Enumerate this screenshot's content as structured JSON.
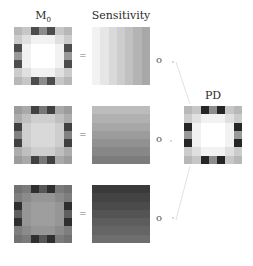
{
  "titles": {
    "m0": "M",
    "m0_sub": "0",
    "sensitivity": "Sensitivity",
    "pd": "PD"
  },
  "operators": {
    "equals": "=",
    "compose": "o"
  },
  "rows": [
    {
      "name": "row-1",
      "m0_intensity": 1.0,
      "sensitivity_direction": "horizontal",
      "sens_start": "#f2f2f2",
      "sens_end": "#a8a8a8"
    },
    {
      "name": "row-2",
      "m0_intensity": 0.85,
      "sensitivity_direction": "vertical",
      "sens_start": "#bcbcbc",
      "sens_end": "#7c7c7c"
    },
    {
      "name": "row-3",
      "m0_intensity": 0.62,
      "sensitivity_direction": "vertical",
      "sens_start": "#3a3a3a",
      "sens_end": "#6e6e6e"
    }
  ],
  "pattern_7x7": [
    [
      0.72,
      0.78,
      0.3,
      0.55,
      0.3,
      0.78,
      0.72
    ],
    [
      0.8,
      0.88,
      0.95,
      0.95,
      0.95,
      0.88,
      0.8
    ],
    [
      0.3,
      0.95,
      1.0,
      1.0,
      1.0,
      0.95,
      0.3
    ],
    [
      0.6,
      0.95,
      1.0,
      1.0,
      1.0,
      0.95,
      0.6
    ],
    [
      0.3,
      0.95,
      1.0,
      1.0,
      1.0,
      0.95,
      0.3
    ],
    [
      0.8,
      0.88,
      0.95,
      0.95,
      0.95,
      0.88,
      0.8
    ],
    [
      0.72,
      0.78,
      0.3,
      0.55,
      0.3,
      0.78,
      0.72
    ]
  ]
}
